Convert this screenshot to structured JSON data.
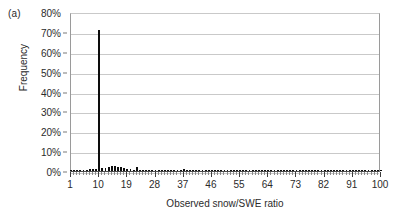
{
  "figure": {
    "panel_label": "(a)"
  },
  "chart_data": {
    "type": "bar",
    "title": "",
    "panel": "(a)",
    "xlabel": "Observed snow/SWE ratio",
    "ylabel": "Frequency",
    "xlim": [
      1,
      100
    ],
    "ylim": [
      0,
      80
    ],
    "ytick_labels": [
      "0%",
      "10%",
      "20%",
      "30%",
      "40%",
      "50%",
      "60%",
      "70%",
      "80%"
    ],
    "ytick_values": [
      0,
      10,
      20,
      30,
      40,
      50,
      60,
      70,
      80
    ],
    "xtick_labels": [
      "1",
      "10",
      "19",
      "28",
      "37",
      "46",
      "55",
      "64",
      "73",
      "82",
      "91",
      "100"
    ],
    "xtick_values": [
      1,
      10,
      19,
      28,
      37,
      46,
      55,
      64,
      73,
      82,
      91,
      100
    ],
    "xtick_interval": 9,
    "minor_tick_interval": 1,
    "grid": "horizontal",
    "legend": "none",
    "bar_color": "#0d0d0d",
    "gridline_color": "#c9c9c9",
    "axis_color": "#4d4d4d",
    "categories": [
      1,
      2,
      3,
      4,
      5,
      6,
      7,
      8,
      9,
      10,
      11,
      12,
      13,
      14,
      15,
      16,
      17,
      18,
      19,
      20,
      21,
      22,
      23,
      24,
      25,
      26,
      27,
      28,
      29,
      30,
      31,
      32,
      33,
      34,
      35,
      36,
      37,
      38,
      39,
      40,
      41,
      42,
      43,
      44,
      45,
      46,
      47,
      48,
      49,
      50,
      51,
      52,
      53,
      54,
      55,
      56,
      57,
      58,
      59,
      60,
      61,
      62,
      63,
      64,
      65,
      66,
      67,
      68,
      69,
      70,
      71,
      72,
      73,
      74,
      75,
      76,
      77,
      78,
      79,
      80,
      81,
      82,
      83,
      84,
      85,
      86,
      87,
      88,
      89,
      90,
      91,
      92,
      93,
      94,
      95,
      96,
      97,
      98,
      99,
      100
    ],
    "values": [
      0.2,
      0.2,
      0.3,
      0.3,
      0.4,
      0.5,
      0.8,
      1.0,
      1.2,
      71.0,
      1.4,
      1.6,
      2.2,
      2.6,
      2.4,
      2.2,
      1.8,
      1.4,
      1.0,
      0.8,
      0.6,
      2.0,
      0.5,
      0.4,
      0.3,
      0.3,
      0.3,
      0.3,
      0.2,
      0.2,
      0.2,
      0.2,
      0.2,
      0.2,
      0.2,
      0.2,
      0.8,
      0.2,
      0.2,
      0.2,
      0.2,
      0.2,
      0.2,
      0.2,
      0.2,
      0.2,
      0.2,
      0.2,
      0.2,
      0.6,
      0.2,
      0.2,
      0.2,
      0.2,
      0.2,
      0.2,
      0.2,
      0.2,
      0.2,
      0.2,
      0.2,
      0.2,
      0.2,
      0.2,
      0.2,
      0.2,
      0.2,
      0.2,
      0.2,
      0.2,
      0.2,
      0.2,
      0.2,
      0.2,
      0.2,
      0.2,
      0.2,
      0.2,
      0.2,
      0.2,
      0.2,
      0.2,
      0.2,
      0.2,
      0.2,
      0.2,
      0.2,
      0.2,
      0.2,
      0.2,
      0.2,
      0.2,
      0.2,
      0.2,
      0.2,
      0.2,
      0.2,
      0.2,
      0.2,
      0.2
    ]
  }
}
